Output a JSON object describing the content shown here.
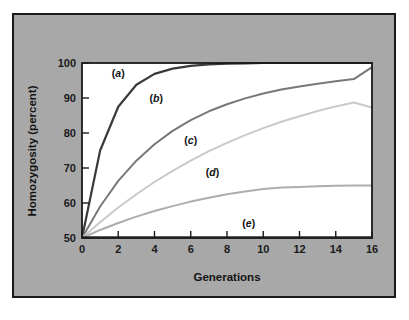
{
  "figure": {
    "background_color": "#a8a8a8",
    "plot_background_color": "#ffffff",
    "frame_color": "#1a1a1a"
  },
  "axes": {
    "y_title": "Homozygosity (percent)",
    "x_title": "Generations",
    "y_ticks": [
      "50",
      "60",
      "70",
      "80",
      "90",
      "100"
    ],
    "x_ticks": [
      "0",
      "2",
      "4",
      "6",
      "8",
      "10",
      "12",
      "14",
      "16"
    ]
  },
  "chart_data": {
    "type": "line",
    "title": "",
    "xlabel": "Generations",
    "ylabel": "Homozygosity (percent)",
    "xlim": [
      0,
      16
    ],
    "ylim": [
      50,
      100
    ],
    "xticks": [
      0,
      2,
      4,
      6,
      8,
      10,
      12,
      14,
      16
    ],
    "yticks": [
      50,
      60,
      70,
      80,
      90,
      100
    ],
    "grid": false,
    "legend": "inline-curve-labels",
    "x": [
      0,
      1,
      2,
      3,
      4,
      5,
      6,
      7,
      8,
      9,
      10,
      11,
      12,
      13,
      14,
      15,
      16
    ],
    "series": [
      {
        "name": "(a)",
        "label": "a",
        "color": "#3a3a3a",
        "line_width": 2.2,
        "label_x": 2.0,
        "label_y": 96.0,
        "values": [
          50.0,
          75.0,
          87.5,
          93.8,
          96.9,
          98.4,
          99.2,
          99.6,
          99.8,
          99.9,
          100.0,
          100.0,
          100.0,
          100.0,
          100.0,
          100.0,
          100.0
        ]
      },
      {
        "name": "(b)",
        "label": "b",
        "color": "#787878",
        "line_width": 2.0,
        "label_x": 4.1,
        "label_y": 89.0,
        "values": [
          50.0,
          59.0,
          66.3,
          72.1,
          76.8,
          80.6,
          83.7,
          86.2,
          88.2,
          89.9,
          91.3,
          92.4,
          93.3,
          94.1,
          94.8,
          95.4,
          98.8
        ]
      },
      {
        "name": "(c)",
        "label": "c",
        "color": "#c9c9c9",
        "line_width": 2.0,
        "label_x": 6.0,
        "label_y": 77.0,
        "values": [
          50.0,
          54.5,
          58.7,
          62.5,
          66.0,
          69.2,
          72.1,
          74.8,
          77.2,
          79.4,
          81.4,
          83.2,
          84.8,
          86.3,
          87.6,
          88.7,
          87.3
        ]
      },
      {
        "name": "(d)",
        "label": "d",
        "color": "#adadad",
        "line_width": 2.0,
        "label_x": 7.2,
        "label_y": 67.8,
        "values": [
          50.0,
          52.3,
          54.3,
          56.1,
          57.7,
          59.1,
          60.4,
          61.5,
          62.5,
          63.3,
          64.0,
          64.4,
          64.6,
          64.8,
          64.9,
          65.0,
          65.0
        ]
      },
      {
        "name": "(e)",
        "label": "e",
        "color": "#2b2b2b",
        "line_width": 2.0,
        "label_x": 9.2,
        "label_y": 53.2,
        "values": [
          50.2,
          50.2,
          50.2,
          50.2,
          50.2,
          50.2,
          50.2,
          50.2,
          50.2,
          50.2,
          50.2,
          50.2,
          50.2,
          50.2,
          50.2,
          50.2,
          50.2
        ]
      }
    ]
  }
}
